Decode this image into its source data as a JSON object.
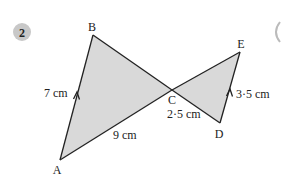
{
  "question": {
    "number": "2",
    "badge_color": "#c8c8c8"
  },
  "figure": {
    "fill_color": "#d9d9d9",
    "stroke_color": "#222222",
    "vertices": {
      "A": {
        "label": "A",
        "x": 60,
        "y": 160
      },
      "B": {
        "label": "B",
        "x": 93,
        "y": 35
      },
      "C": {
        "label": "C",
        "x": 172,
        "y": 90
      },
      "D": {
        "label": "D",
        "x": 220,
        "y": 123
      },
      "E": {
        "label": "E",
        "x": 240,
        "y": 52
      }
    },
    "triangles": [
      {
        "name": "ABC",
        "vertices": [
          "A",
          "B",
          "C"
        ]
      },
      {
        "name": "CDE",
        "vertices": [
          "C",
          "D",
          "E"
        ]
      }
    ],
    "measurements": {
      "AB": "7 cm",
      "AC": "9 cm",
      "CD": "2·5 cm",
      "DE": "3·5 cm"
    },
    "parallel_marks": [
      "AB",
      "DE"
    ]
  }
}
